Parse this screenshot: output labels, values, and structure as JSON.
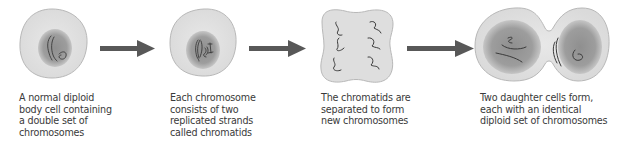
{
  "diagram": {
    "colors": {
      "cell_fill": "#e4e4e4",
      "cell_stroke": "#b5b5b5",
      "nucleus": "#9a9a9a",
      "nucleus_edge": "#c4c4c4",
      "chromosome": "#3a3a3a",
      "arrow": "#585858",
      "text": "#3a3a3a"
    },
    "stages": [
      {
        "id": "diploid-cell",
        "caption_lines": [
          "A normal diploid",
          "body cell containing",
          "a double set of",
          "chromosomes"
        ]
      },
      {
        "id": "replicated-chromosomes",
        "caption_lines": [
          "Each chromosome",
          "consists of two",
          "replicated strands",
          "called chromatids"
        ]
      },
      {
        "id": "separating-chromatids",
        "caption_lines": [
          "The chromatids are",
          "separated to form",
          "new chromosomes"
        ]
      },
      {
        "id": "daughter-cells",
        "caption_lines": [
          "Two daughter cells form,",
          "each with an identical",
          "diploid set of chromosomes"
        ]
      }
    ],
    "arrows": [
      {
        "from": "diploid-cell",
        "to": "replicated-chromosomes"
      },
      {
        "from": "replicated-chromosomes",
        "to": "separating-chromatids"
      },
      {
        "from": "separating-chromatids",
        "to": "daughter-cells"
      }
    ]
  }
}
